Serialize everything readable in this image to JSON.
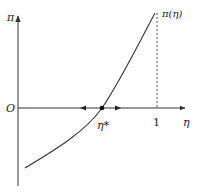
{
  "diagram": {
    "type": "function-graph",
    "labels": {
      "y_axis": "π",
      "x_axis": "η",
      "origin": "O",
      "tick_one": "1",
      "curve": "π(η)",
      "fixed_point": "η*"
    },
    "colors": {
      "axis": "#333333",
      "curve": "#333333",
      "dashed": "#555555",
      "point": "#111111"
    },
    "elements": [
      "y-axis with arrow",
      "x-axis with arrow",
      "increasing convex curve π(η)",
      "dashed vertical line at η = 1",
      "fixed point η* where curve crosses η-axis",
      "stability arrows pointing away from η*"
    ]
  }
}
